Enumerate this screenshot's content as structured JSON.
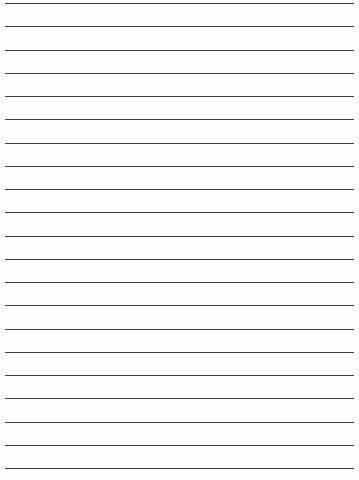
{
  "page": {
    "type": "lined-paper",
    "line_count": 21,
    "first_line_y": 3,
    "line_spacing": 23.25,
    "line_left": 5,
    "line_width": 349,
    "line_color": "#3a3a3a",
    "background_color": "#fefefe"
  }
}
